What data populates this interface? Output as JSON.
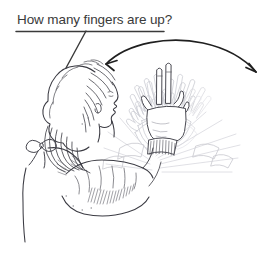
{
  "image": {
    "width": 275,
    "height": 280,
    "background_color": "#ffffff",
    "medium": "pen-and-ink line drawing",
    "ink_color": "#303030",
    "ghost_ink_color": "#c9c9cf"
  },
  "caption": {
    "text": "How many fingers are up?",
    "underlined": true,
    "color": "#3a3a3a",
    "has_leader_line": true,
    "leader_points_to": "girl-head"
  },
  "annotations": {
    "motion_arrow": {
      "name": "waving-motion-arrow",
      "style": "curved double-headed arc",
      "direction": "back-and-forth",
      "color": "#1f1f1f"
    }
  },
  "subject": {
    "name": "girl-figure",
    "view": "profile facing right",
    "features": [
      "curly-hair",
      "ponytail",
      "ribbon-bow-collar",
      "raised-arm",
      "waving-hand"
    ]
  },
  "hand": {
    "name": "waving-hand",
    "fingers_up": 2,
    "gesture": "two fingers extended",
    "motion_blur_copies": 7
  }
}
